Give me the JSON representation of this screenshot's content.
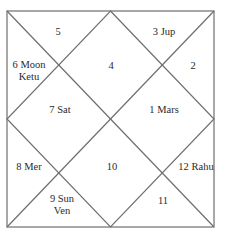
{
  "chart": {
    "type": "north-indian-horoscope",
    "line_color": "#6e6e6e",
    "houses": [
      {
        "id": "h1",
        "number": "1",
        "planets": [
          "Mars"
        ],
        "line1": "1 Mars",
        "line2": ""
      },
      {
        "id": "h2",
        "number": "2",
        "planets": [],
        "line1": "2",
        "line2": ""
      },
      {
        "id": "h3",
        "number": "3",
        "planets": [
          "Jup"
        ],
        "line1": "3 Jup",
        "line2": ""
      },
      {
        "id": "h4",
        "number": "4",
        "planets": [],
        "line1": "4",
        "line2": ""
      },
      {
        "id": "h5",
        "number": "5",
        "planets": [],
        "line1": "5",
        "line2": ""
      },
      {
        "id": "h6",
        "number": "6",
        "planets": [
          "Moon",
          "Ketu"
        ],
        "line1": "6 Moon",
        "line2": "Ketu"
      },
      {
        "id": "h7",
        "number": "7",
        "planets": [
          "Sat"
        ],
        "line1": "7 Sat",
        "line2": ""
      },
      {
        "id": "h8",
        "number": "8",
        "planets": [
          "Mer"
        ],
        "line1": "8 Mer",
        "line2": ""
      },
      {
        "id": "h9",
        "number": "9",
        "planets": [
          "Sun",
          "Ven"
        ],
        "line1": "9 Sun",
        "line2": "Ven"
      },
      {
        "id": "h10",
        "number": "10",
        "planets": [],
        "line1": "10",
        "line2": ""
      },
      {
        "id": "h11",
        "number": "11",
        "planets": [],
        "line1": "11",
        "line2": ""
      },
      {
        "id": "h12",
        "number": "12",
        "planets": [
          "Rahu"
        ],
        "line1": "12 Rahu",
        "line2": ""
      }
    ]
  }
}
